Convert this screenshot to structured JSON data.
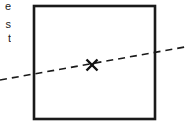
{
  "figure": {
    "title": "",
    "background_color": "#ffffff",
    "stroke_color": "#1a1a1a",
    "width": 185,
    "height": 125,
    "box": {
      "name": "rectangle-outline",
      "x": 34,
      "y": 6,
      "width": 121,
      "height": 113,
      "stroke_width": 2.6,
      "fill": "none",
      "color": "#1a1a1a"
    },
    "dashed_line": {
      "name": "dashed-diagonal-line",
      "x1": 0,
      "y1": 80,
      "x2": 185,
      "y2": 47,
      "stroke_width": 1.6,
      "dash_length": 7,
      "gap_length": 5,
      "color": "#1a1a1a"
    },
    "marker": {
      "name": "x-marker",
      "symbol": "×",
      "cx": 92,
      "cy": 65,
      "size": 11,
      "stroke_width": 2.4,
      "color": "#111111"
    },
    "clipped_text": {
      "note": "text truncated at left edge of image",
      "lines": [
        "e",
        "s",
        "t"
      ]
    }
  }
}
